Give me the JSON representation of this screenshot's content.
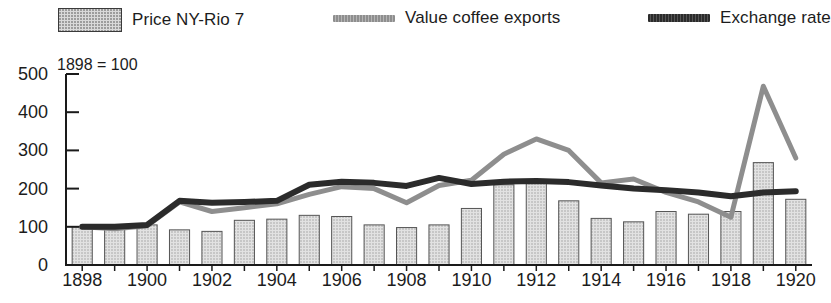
{
  "legend": {
    "items": [
      {
        "label": "Price NY-Rio 7",
        "marker": "bar-swatch",
        "color": "#d9d9d9"
      },
      {
        "label": "Value coffee exports",
        "marker": "line-swatch",
        "color": "#8e8e8e"
      },
      {
        "label": "Exchange rate",
        "marker": "line-swatch",
        "color": "#2b2b2b"
      }
    ]
  },
  "chart_data": {
    "type": "bar",
    "title": "",
    "subtitle": "1898 = 100",
    "xlabel": "",
    "ylabel": "",
    "ylim": [
      0,
      500
    ],
    "yticks": [
      0,
      100,
      200,
      300,
      400,
      500
    ],
    "ytick_labels": [
      "0",
      "100",
      "200",
      "300",
      "400",
      "500"
    ],
    "xlim": [
      1898,
      1920
    ],
    "xticks": [
      1898,
      1900,
      1902,
      1904,
      1906,
      1908,
      1910,
      1912,
      1914,
      1916,
      1918,
      1920
    ],
    "xtick_labels": [
      "1898",
      "1900",
      "1902",
      "1904",
      "1906",
      "1908",
      "1910",
      "1912",
      "1914",
      "1916",
      "1918",
      "1920"
    ],
    "grid": false,
    "legend_position": "top",
    "x": [
      1898,
      1899,
      1900,
      1901,
      1902,
      1903,
      1904,
      1905,
      1906,
      1907,
      1908,
      1909,
      1910,
      1911,
      1912,
      1913,
      1914,
      1915,
      1916,
      1917,
      1918,
      1919,
      1920
    ],
    "series": [
      {
        "name": "Price NY-Rio 7",
        "type": "bar",
        "color": "#d9d9d9",
        "edge_color": "#555555",
        "values": [
          100,
          95,
          105,
          92,
          88,
          117,
          120,
          130,
          127,
          105,
          98,
          105,
          148,
          210,
          215,
          168,
          122,
          113,
          140,
          133,
          140,
          268,
          172
        ]
      },
      {
        "name": "Value coffee exports",
        "type": "line",
        "color": "#8e8e8e",
        "values": [
          100,
          95,
          103,
          165,
          140,
          150,
          160,
          185,
          205,
          200,
          163,
          208,
          222,
          290,
          330,
          300,
          215,
          225,
          190,
          165,
          125,
          468,
          280
        ]
      },
      {
        "name": "Exchange rate",
        "type": "line",
        "color": "#2b2b2b",
        "values": [
          100,
          100,
          105,
          168,
          163,
          165,
          168,
          210,
          218,
          215,
          207,
          228,
          212,
          218,
          220,
          217,
          208,
          200,
          196,
          190,
          180,
          190,
          193
        ]
      }
    ]
  }
}
